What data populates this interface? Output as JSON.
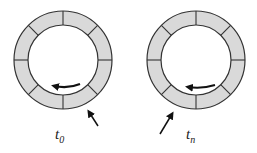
{
  "diagram": {
    "segment_count": 8,
    "colors": {
      "segment_fill": "#d9d9d9",
      "stroke": "#333333",
      "background": "#ffffff"
    },
    "rings": [
      {
        "id": "ring-t0",
        "label_base": "t",
        "label_sub": "0",
        "pointer_position": "bottom-right"
      },
      {
        "id": "ring-tn",
        "label_base": "t",
        "label_sub": "n",
        "pointer_position": "bottom-left"
      }
    ]
  }
}
